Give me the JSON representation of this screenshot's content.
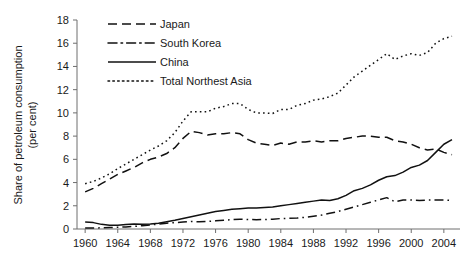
{
  "chart_data": {
    "type": "line",
    "title": "",
    "xlabel": "",
    "ylabel": "Share of petroleum consumption (per cent)",
    "ylabel_line1": "Share of petroleum consumption",
    "ylabel_line2": "(per cent)",
    "xlim": [
      1959,
      2005
    ],
    "ylim": [
      0,
      18
    ],
    "y_ticks": [
      0,
      2,
      4,
      6,
      8,
      10,
      12,
      14,
      16,
      18
    ],
    "x_ticks": [
      1960,
      1964,
      1968,
      1972,
      1976,
      1980,
      1984,
      1988,
      1992,
      1996,
      2000,
      2004
    ],
    "grid": false,
    "legend_position": "top-center",
    "x": [
      1960,
      1961,
      1962,
      1963,
      1964,
      1965,
      1966,
      1967,
      1968,
      1969,
      1970,
      1971,
      1972,
      1973,
      1974,
      1975,
      1976,
      1977,
      1978,
      1979,
      1980,
      1981,
      1982,
      1983,
      1984,
      1985,
      1986,
      1987,
      1988,
      1989,
      1990,
      1991,
      1992,
      1993,
      1994,
      1995,
      1996,
      1997,
      1998,
      1999,
      2000,
      2001,
      2002,
      2003,
      2004,
      2005
    ],
    "series": [
      {
        "name": "Japan",
        "style": "dashed",
        "values": [
          3.2,
          3.5,
          3.9,
          4.3,
          4.7,
          5.0,
          5.3,
          5.7,
          6.0,
          6.2,
          6.5,
          7.0,
          7.8,
          8.4,
          8.3,
          8.1,
          8.2,
          8.2,
          8.3,
          8.2,
          7.7,
          7.4,
          7.3,
          7.2,
          7.4,
          7.3,
          7.5,
          7.5,
          7.6,
          7.5,
          7.6,
          7.6,
          7.8,
          7.9,
          8.0,
          8.0,
          7.9,
          7.9,
          7.6,
          7.5,
          7.3,
          7.0,
          6.8,
          6.9,
          6.6,
          6.4
        ]
      },
      {
        "name": "South Korea",
        "style": "dash-dot",
        "values": [
          0.08,
          0.09,
          0.1,
          0.12,
          0.15,
          0.18,
          0.22,
          0.28,
          0.35,
          0.42,
          0.5,
          0.55,
          0.6,
          0.65,
          0.62,
          0.65,
          0.7,
          0.75,
          0.8,
          0.85,
          0.82,
          0.8,
          0.82,
          0.85,
          0.9,
          0.92,
          0.95,
          1.0,
          1.1,
          1.2,
          1.35,
          1.5,
          1.7,
          1.9,
          2.1,
          2.3,
          2.5,
          2.7,
          2.35,
          2.5,
          2.5,
          2.45,
          2.5,
          2.5,
          2.5,
          2.45
        ]
      },
      {
        "name": "China",
        "style": "solid",
        "values": [
          0.6,
          0.55,
          0.4,
          0.32,
          0.33,
          0.38,
          0.42,
          0.4,
          0.42,
          0.5,
          0.62,
          0.75,
          0.9,
          1.05,
          1.2,
          1.35,
          1.5,
          1.6,
          1.7,
          1.75,
          1.8,
          1.8,
          1.85,
          1.9,
          2.0,
          2.1,
          2.2,
          2.3,
          2.4,
          2.5,
          2.45,
          2.6,
          2.9,
          3.3,
          3.5,
          3.8,
          4.2,
          4.5,
          4.6,
          4.9,
          5.3,
          5.5,
          5.9,
          6.6,
          7.3,
          7.7
        ]
      },
      {
        "name": "Total Northest Asia",
        "style": "dotted",
        "values": [
          3.9,
          4.1,
          4.4,
          4.75,
          5.2,
          5.6,
          6.0,
          6.4,
          6.8,
          7.15,
          7.6,
          8.3,
          9.3,
          10.1,
          10.1,
          10.1,
          10.4,
          10.55,
          10.8,
          10.8,
          10.3,
          10.0,
          10.0,
          9.95,
          10.3,
          10.3,
          10.65,
          10.8,
          11.1,
          11.2,
          11.4,
          11.7,
          12.4,
          13.1,
          13.6,
          14.1,
          14.6,
          15.1,
          14.6,
          14.9,
          15.1,
          14.95,
          15.2,
          16.0,
          16.4,
          16.6
        ]
      }
    ],
    "legend": [
      {
        "label": "Japan",
        "style": "dashed"
      },
      {
        "label": "South Korea",
        "style": "dash-dot"
      },
      {
        "label": "China",
        "style": "solid"
      },
      {
        "label": "Total Northest Asia",
        "style": "dotted"
      }
    ],
    "colors": {
      "series": "#111111",
      "axis": "#6e6e6e",
      "text": "#1a1a1a",
      "background": "#ffffff"
    }
  }
}
